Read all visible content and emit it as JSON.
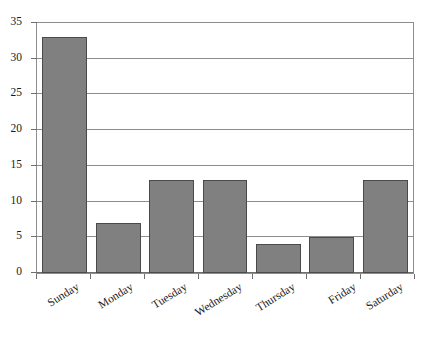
{
  "chart_data": {
    "type": "bar",
    "title": "",
    "subtitle": "",
    "xlabel": "",
    "ylabel": "",
    "categories": [
      "Sunday",
      "Monday",
      "Tuesday",
      "Wednesday",
      "Thursday",
      "Friday",
      "Saturday"
    ],
    "values": [
      33,
      7,
      13,
      13,
      4,
      5,
      13
    ],
    "ylim": [
      0,
      35
    ],
    "ytick_values": [
      0,
      5,
      10,
      15,
      20,
      25,
      30,
      35
    ],
    "ytick_labels": [
      "0",
      "5",
      "10",
      "15",
      "20",
      "25",
      "30",
      "35"
    ],
    "grid": "horizontal",
    "legend": "none",
    "bar_color": "#808080",
    "bar_border_color": "#4a4a4a",
    "gridline_color": "#8d8d8d",
    "axis_color": "#6f6f6f",
    "background_color": "#ffffff",
    "xtick_label_rotation": -32
  }
}
